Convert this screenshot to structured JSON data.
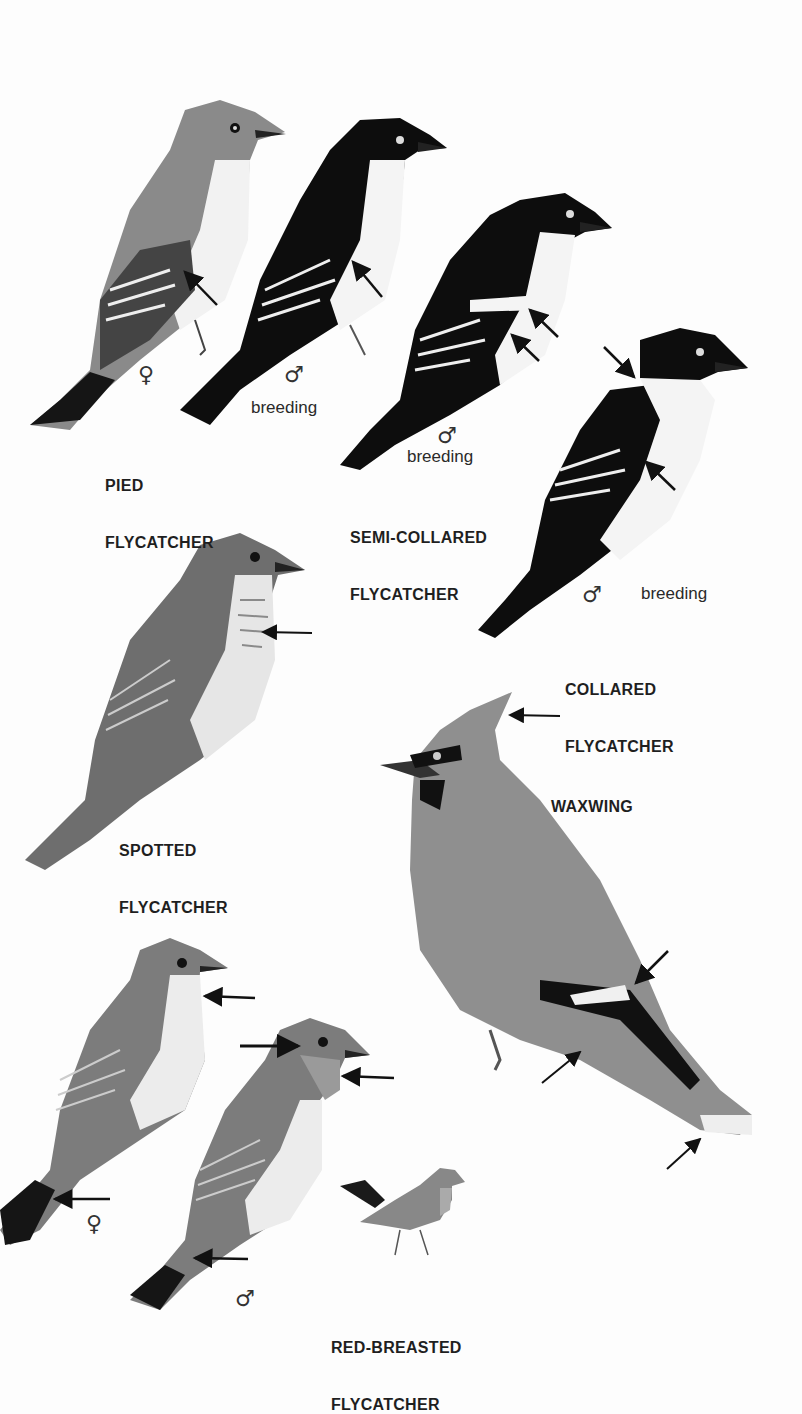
{
  "plate": {
    "background": "#fdfdfd",
    "species": [
      {
        "id": "pied",
        "name_line1": "PIED",
        "name_line2": "FLYCATCHER",
        "figures": [
          {
            "sex": "♀",
            "note": ""
          },
          {
            "sex": "♂",
            "note": "breeding"
          }
        ]
      },
      {
        "id": "semi-collared",
        "name_line1": "SEMI-COLLARED",
        "name_line2": "FLYCATCHER",
        "figures": [
          {
            "sex": "♂",
            "note": "breeding"
          }
        ]
      },
      {
        "id": "collared",
        "name_line1": "COLLARED",
        "name_line2": "FLYCATCHER",
        "figures": [
          {
            "sex": "♂",
            "note": "breeding"
          }
        ]
      },
      {
        "id": "spotted",
        "name_line1": "SPOTTED",
        "name_line2": "FLYCATCHER",
        "figures": []
      },
      {
        "id": "waxwing",
        "name_line1": "WAXWING",
        "name_line2": "",
        "figures": []
      },
      {
        "id": "red-breasted",
        "name_line1": "RED-BREASTED",
        "name_line2": "FLYCATCHER",
        "figures": [
          {
            "sex": "♀",
            "note": ""
          },
          {
            "sex": "♂",
            "note": ""
          }
        ]
      }
    ]
  }
}
